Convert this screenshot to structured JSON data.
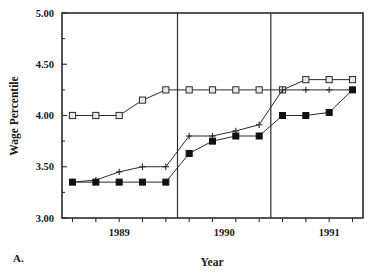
{
  "panel": {
    "label": "A."
  },
  "chart_data": {
    "type": "line",
    "title": "",
    "xlabel": "Year",
    "ylabel": "Wage Percentile",
    "ylim": [
      3.0,
      5.0
    ],
    "yticks": [
      "3.00",
      "3.50",
      "4.00",
      "4.50",
      "5.00"
    ],
    "ytick_values": [
      3.0,
      3.5,
      4.0,
      4.5,
      5.0
    ],
    "yminor_values": [
      3.25,
      3.75,
      4.25,
      4.75
    ],
    "xtick_labels": [
      "1989",
      "1990",
      "1991"
    ],
    "xtick_positions": [
      2.0,
      6.5,
      11.0
    ],
    "grid": false,
    "legend": "none",
    "x": [
      0,
      1,
      2,
      3,
      4,
      5,
      6,
      7,
      8,
      9,
      10,
      11,
      12
    ],
    "vertical_dividers": [
      4.5,
      8.5
    ],
    "series": [
      {
        "name": "upper",
        "marker": "open-square",
        "values": [
          4.0,
          4.0,
          4.0,
          4.15,
          4.25,
          4.25,
          4.25,
          4.25,
          4.25,
          4.25,
          4.35,
          4.35,
          4.35
        ]
      },
      {
        "name": "middle",
        "marker": "plus",
        "values": [
          3.35,
          3.37,
          3.45,
          3.5,
          3.5,
          3.8,
          3.8,
          3.85,
          3.91,
          4.25,
          4.25,
          4.25,
          4.25
        ]
      },
      {
        "name": "lower",
        "marker": "filled-square",
        "values": [
          3.35,
          3.35,
          3.35,
          3.35,
          3.35,
          3.63,
          3.75,
          3.8,
          3.8,
          4.0,
          4.0,
          4.03,
          4.25
        ]
      }
    ]
  }
}
